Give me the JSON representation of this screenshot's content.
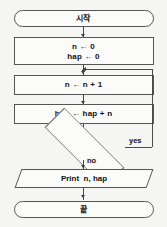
{
  "diagram": {
    "type": "flowchart",
    "language": "ko",
    "colors": {
      "background": "#f5f5f4",
      "node_fill": "#fbfbfa",
      "node_stroke": "#555555",
      "connector": "#4a4a4a",
      "text": "#111111"
    },
    "nodes": [
      {
        "id": "start",
        "shape": "terminator",
        "text": "시작"
      },
      {
        "id": "init",
        "shape": "process",
        "text": "n ← 0\nhap ← 0",
        "line1": "n ← 0",
        "line2": "hap ← 0"
      },
      {
        "id": "incr",
        "shape": "process",
        "text": "n ← n + 1"
      },
      {
        "id": "accum",
        "shape": "process",
        "text": "hap ← hap + n"
      },
      {
        "id": "decide",
        "shape": "diamond",
        "text": ""
      },
      {
        "id": "print",
        "shape": "parallelogram",
        "text": "Print  n, hap"
      },
      {
        "id": "end",
        "shape": "terminator",
        "text": "끝"
      }
    ],
    "edges": [
      {
        "from": "start",
        "to": "init",
        "label": ""
      },
      {
        "from": "init",
        "to": "incr",
        "label": ""
      },
      {
        "from": "incr",
        "to": "accum",
        "label": ""
      },
      {
        "from": "accum",
        "to": "decide",
        "label": ""
      },
      {
        "from": "decide",
        "to": "incr",
        "label": "yes"
      },
      {
        "from": "decide",
        "to": "print",
        "label": "no"
      },
      {
        "from": "print",
        "to": "end",
        "label": ""
      }
    ],
    "labels": {
      "yes": "yes",
      "no": "no"
    }
  }
}
